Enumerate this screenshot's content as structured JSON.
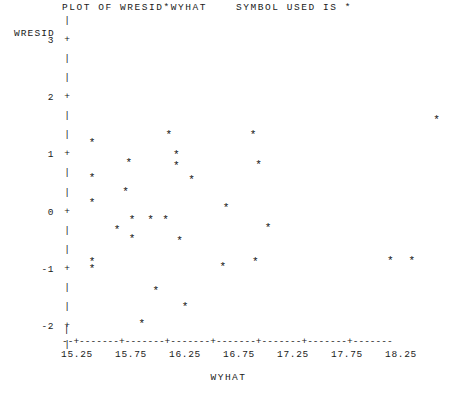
{
  "title": "PLOT OF WRESID*WYHAT    SYMBOL USED IS *",
  "ylabel": "WRESID",
  "xlabel": "WYHAT",
  "symbol": "*",
  "axis": {
    "vertical_bar": "|",
    "tick_mark": "+",
    "horizontal_rule": "--+-------+-------+-------+-------+-------+-------+-------",
    "leading_bar": "|"
  },
  "chart_data": {
    "type": "scatter",
    "title": "PLOT OF WRESID*WYHAT    SYMBOL USED IS *",
    "xlabel": "WYHAT",
    "ylabel": "WRESID",
    "symbol": "*",
    "grid": false,
    "legend": null,
    "xlim": [
      15.05,
      18.7
    ],
    "ylim": [
      -2.2,
      3.0
    ],
    "xticks": [
      15.25,
      15.75,
      16.25,
      16.75,
      17.25,
      17.75,
      18.25
    ],
    "xtick_labels": [
      "15.25",
      "15.75",
      "16.25",
      "16.75",
      "17.25",
      "17.75",
      "18.25"
    ],
    "yticks": [
      3,
      2,
      1,
      0,
      -1,
      -2
    ],
    "ytick_labels": [
      "3",
      "2",
      "1",
      "0",
      "-1",
      "-2"
    ],
    "points": [
      {
        "x": 15.39,
        "y": 1.23
      },
      {
        "x": 15.39,
        "y": 0.63
      },
      {
        "x": 15.39,
        "y": 0.18
      },
      {
        "x": 15.39,
        "y": -0.85
      },
      {
        "x": 15.39,
        "y": -0.97
      },
      {
        "x": 15.62,
        "y": -0.28
      },
      {
        "x": 15.7,
        "y": 0.38
      },
      {
        "x": 15.73,
        "y": 0.88
      },
      {
        "x": 15.76,
        "y": -0.45
      },
      {
        "x": 15.76,
        "y": -0.12
      },
      {
        "x": 15.85,
        "y": -1.93
      },
      {
        "x": 15.93,
        "y": -0.12
      },
      {
        "x": 15.98,
        "y": -1.35
      },
      {
        "x": 16.07,
        "y": -0.12
      },
      {
        "x": 16.1,
        "y": 1.38
      },
      {
        "x": 16.17,
        "y": 1.03
      },
      {
        "x": 16.17,
        "y": 0.83
      },
      {
        "x": 16.2,
        "y": -0.48
      },
      {
        "x": 16.25,
        "y": -1.63
      },
      {
        "x": 16.31,
        "y": 0.58
      },
      {
        "x": 16.6,
        "y": -0.93
      },
      {
        "x": 16.63,
        "y": 0.1
      },
      {
        "x": 16.88,
        "y": 1.38
      },
      {
        "x": 16.9,
        "y": -0.85
      },
      {
        "x": 16.93,
        "y": 0.85
      },
      {
        "x": 17.02,
        "y": -0.25
      },
      {
        "x": 18.15,
        "y": -0.82
      },
      {
        "x": 18.35,
        "y": -0.82
      },
      {
        "x": 18.58,
        "y": 1.63
      }
    ]
  }
}
